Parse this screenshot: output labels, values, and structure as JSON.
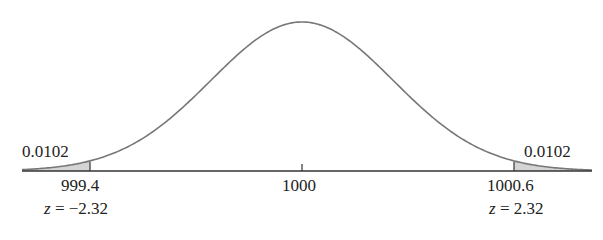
{
  "chart_data": {
    "type": "area",
    "title": "",
    "distribution": "normal",
    "mean": 1000,
    "xlabel": "",
    "ylabel": "",
    "ticks": [
      {
        "value": 999.4,
        "label": "999.4",
        "z_label": "z = −2.32"
      },
      {
        "value": 1000,
        "label": "1000"
      },
      {
        "value": 1000.6,
        "label": "1000.6",
        "z_label": "z = 2.32"
      }
    ],
    "shaded_regions": [
      {
        "side": "left",
        "upper_bound": 999.4,
        "area": 0.0102,
        "label": "0.0102"
      },
      {
        "side": "right",
        "lower_bound": 1000.6,
        "area": 0.0102,
        "label": "0.0102"
      }
    ],
    "colors": {
      "curve": "#777777",
      "shade": "#d4d4d4",
      "axis": "#333333"
    },
    "grid": false,
    "legend": null
  },
  "labels": {
    "left_area": "0.0102",
    "right_area": "0.0102",
    "left_tick": "999.4",
    "center_tick": "1000",
    "right_tick": "1000.6",
    "left_z_var": "z",
    "left_z_rest": " = −2.32",
    "right_z_var": "z",
    "right_z_rest": " = 2.32"
  }
}
